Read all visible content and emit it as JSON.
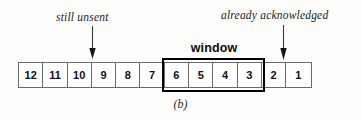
{
  "figure": {
    "caption": "(b)",
    "background_color": "#fdfdfc"
  },
  "window": {
    "label": "window",
    "covers_cells": [
      "6",
      "5",
      "4",
      "3"
    ],
    "border_color": "#000000"
  },
  "annotations": [
    {
      "id": "still-unsent",
      "text": "still unsent",
      "arrow": "down-arrow-icon",
      "points_to": "boundary between cells 10 and 9"
    },
    {
      "id": "already-acknowledged",
      "text": "already acknowledged",
      "arrow": "down-arrow-icon",
      "points_to": "cell 2"
    }
  ],
  "sequence": {
    "cells": [
      {
        "label": "12",
        "in_window": false
      },
      {
        "label": "11",
        "in_window": false
      },
      {
        "label": "10",
        "in_window": false
      },
      {
        "label": "9",
        "in_window": false
      },
      {
        "label": "8",
        "in_window": false
      },
      {
        "label": "7",
        "in_window": false
      },
      {
        "label": "6",
        "in_window": true
      },
      {
        "label": "5",
        "in_window": true
      },
      {
        "label": "4",
        "in_window": true
      },
      {
        "label": "3",
        "in_window": true
      },
      {
        "label": "2",
        "in_window": false
      },
      {
        "label": "1",
        "in_window": false
      }
    ],
    "cell_border_color": "#6b6b6b"
  }
}
